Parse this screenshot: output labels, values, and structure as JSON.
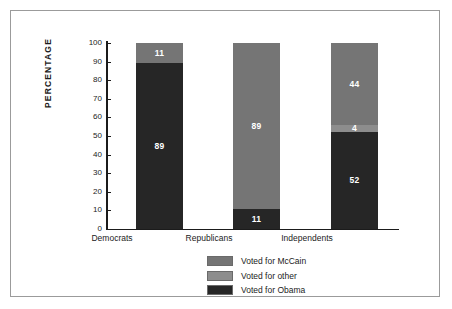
{
  "chart_data": {
    "type": "bar",
    "subtype": "stacked-bar",
    "title": "",
    "xlabel": "",
    "ylabel": "PERCENTAGE",
    "ylim": [
      0,
      100
    ],
    "yticks": [
      100,
      90,
      80,
      70,
      60,
      50,
      40,
      30,
      20,
      10,
      0
    ],
    "grid": false,
    "legend_position": "bottom-center",
    "categories": [
      "Democrats",
      "Republicans",
      "Independents"
    ],
    "series": [
      {
        "name": "Voted for McCain",
        "color": "#757575",
        "values": [
          11,
          89,
          44
        ]
      },
      {
        "name": "Voted for other",
        "color": "#8d8d8d",
        "values": [
          0,
          0,
          4
        ]
      },
      {
        "name": "Voted for Obama",
        "color": "#262626",
        "values": [
          89,
          11,
          52
        ]
      }
    ],
    "stack_order_bottom_to_top": [
      "Voted for Obama",
      "Voted for other",
      "Voted for McCain"
    ],
    "data_labels": {
      "Democrats": [
        {
          "series": "Voted for Obama",
          "value": "89"
        },
        {
          "series": "Voted for McCain",
          "value": "11"
        }
      ],
      "Republicans": [
        {
          "series": "Voted for Obama",
          "value": "11"
        },
        {
          "series": "Voted for McCain",
          "value": "89"
        }
      ],
      "Independents": [
        {
          "series": "Voted for Obama",
          "value": "52"
        },
        {
          "series": "Voted for other",
          "value": "4"
        },
        {
          "series": "Voted for McCain",
          "value": "44"
        }
      ]
    }
  },
  "axis": {
    "y_title": "PERCENTAGE",
    "ticks": [
      "100",
      "90",
      "80",
      "70",
      "60",
      "50",
      "40",
      "30",
      "20",
      "10",
      "0"
    ]
  },
  "bars": {
    "democrats": {
      "category": "Democrats",
      "obama": "89",
      "other": "",
      "mccain": "11"
    },
    "republicans": {
      "category": "Republicans",
      "obama": "11",
      "other": "",
      "mccain": "89"
    },
    "independents": {
      "category": "Independents",
      "obama": "52",
      "other": "4",
      "mccain": "44"
    }
  },
  "legend": {
    "items": [
      {
        "label": "Voted for McCain",
        "color": "#757575"
      },
      {
        "label": "Voted for other",
        "color": "#8d8d8d"
      },
      {
        "label": "Voted for Obama",
        "color": "#262626"
      }
    ]
  },
  "colors": {
    "mccain": "#757575",
    "other": "#8d8d8d",
    "obama": "#262626",
    "axis": "#1b1b1b",
    "frame": "#9b9b9b",
    "background": "#ffffff",
    "label_text": "#ffffff"
  }
}
